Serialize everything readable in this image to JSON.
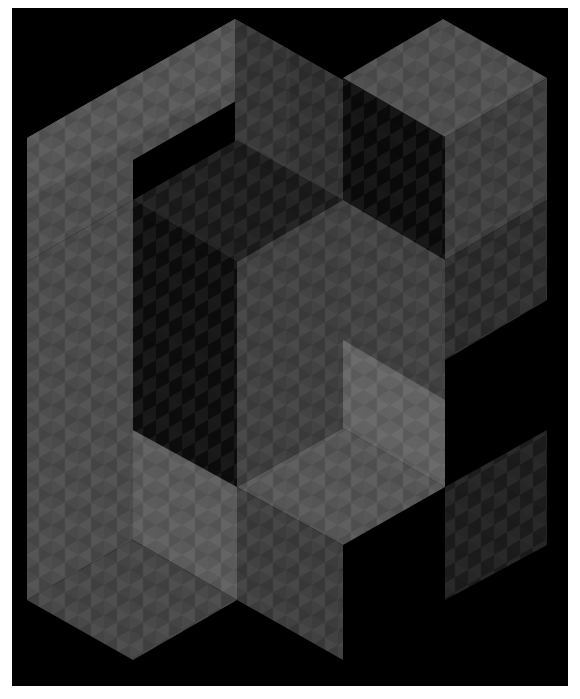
{
  "artwork": {
    "description": "Isometric op-art composition of interlocking gray checkered blocks on black",
    "frame": {
      "x": 12,
      "y": 8,
      "width": 556,
      "height": 678,
      "background": "#000000",
      "page_background": "#ffffff"
    },
    "palette": {
      "black": "#000000",
      "dark": "#2a2a2a",
      "mid_dark": "#3a3a3a",
      "mid": "#4a4a4a",
      "mid_light": "#5c5c5c",
      "light": "#707070",
      "highlight": "#858585"
    },
    "faces": [
      {
        "name": "left-block-top",
        "points": "27,138 235,19 290,50 290,70 133,160 133,200 27,262",
        "fill": "#4c4c4c",
        "checker": "#6a6a6a"
      },
      {
        "name": "left-block-front",
        "points": "27,262 133,200 133,540 27,600",
        "fill": "#4a4a4a",
        "checker": "#686868"
      },
      {
        "name": "left-block-upper-front",
        "points": "27,138 235,19 235,80 27,200",
        "fill": "#555555",
        "checker": "#707070"
      },
      {
        "name": "left-block-side-dark",
        "points": "235,19 290,50 290,260 235,230",
        "fill": "#333333",
        "checker": "#3d3d3d"
      },
      {
        "name": "hole-top-rhombus",
        "points": "133,200 237,140 343,200 237,262",
        "fill": "#1a1a1a",
        "checker": "#2c2c2c"
      },
      {
        "name": "hole-inner-left",
        "points": "133,200 237,262 237,487 133,430",
        "fill": "#0c0c0c",
        "checker": "#262626"
      },
      {
        "name": "hole-inner-right",
        "points": "237,262 343,200 343,428 237,487",
        "fill": "#3e3e3e",
        "checker": "#4c4c4c"
      },
      {
        "name": "center-column",
        "points": "290,50 343,80 343,200 290,170",
        "fill": "#2e2e2e",
        "checker": "#3a3a3a"
      },
      {
        "name": "right-cube-top",
        "points": "343,78 443,19 547,78 445,137",
        "fill": "#4e4e4e",
        "checker": "#686868"
      },
      {
        "name": "right-cube-left",
        "points": "343,78 445,137 445,400 343,340",
        "fill": "#0a0a0a",
        "checker": "#1c1c1c"
      },
      {
        "name": "right-cube-right",
        "points": "445,137 547,78 547,200 445,260",
        "fill": "#3c3c3c",
        "checker": "#484848"
      },
      {
        "name": "right-stair",
        "points": "445,260 547,200 547,300 445,360",
        "fill": "#2a2a2a",
        "checker": "#353535"
      },
      {
        "name": "mid-right-face",
        "points": "343,200 445,260 445,487 343,428",
        "fill": "#404040",
        "checker": "#4e4e4e"
      },
      {
        "name": "lower-right-wall",
        "points": "343,340 445,400 445,487 343,428",
        "fill": "#626262",
        "checker": "#7a7a7a"
      },
      {
        "name": "lower-floor",
        "points": "237,487 343,428 445,487 343,545",
        "fill": "#555555",
        "checker": "#6c6c6c"
      },
      {
        "name": "lower-column-front",
        "points": "133,430 237,487 237,600 133,540",
        "fill": "#5a5a5a",
        "checker": "#747474"
      },
      {
        "name": "lower-column-side",
        "points": "237,487 343,545 343,660 237,600",
        "fill": "#3c3c3c",
        "checker": "#4a4a4a"
      },
      {
        "name": "bottom-floor",
        "points": "27,600 133,540 237,600 133,660",
        "fill": "#444444",
        "checker": "#555555"
      },
      {
        "name": "far-right-ghost-block",
        "points": "445,487 547,430 547,545 445,600",
        "fill": "#1c1c1c",
        "checker": "#2a2a2a"
      }
    ]
  }
}
